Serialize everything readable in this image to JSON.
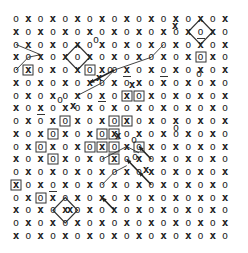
{
  "diagram": {
    "title": "",
    "grid": {
      "rows": 18,
      "cols": 18,
      "origin_x": 16,
      "origin_y": 19,
      "dx": 12.3,
      "dy": 12.75,
      "pattern": "checkerboard",
      "even_symbol": "o",
      "odd_symbol": "x"
    },
    "boxed_cells": [
      {
        "r": 4,
        "c": 1
      },
      {
        "r": 4,
        "c": 6
      },
      {
        "r": 3,
        "c": 15
      },
      {
        "r": 6,
        "c": 9
      },
      {
        "r": 6,
        "c": 10
      },
      {
        "r": 8,
        "c": 8
      },
      {
        "r": 8,
        "c": 9
      },
      {
        "r": 9,
        "c": 3
      },
      {
        "r": 9,
        "c": 7
      },
      {
        "r": 9,
        "c": 8
      },
      {
        "r": 10,
        "c": 2
      },
      {
        "r": 10,
        "c": 6
      },
      {
        "r": 10,
        "c": 7
      },
      {
        "r": 11,
        "c": 3
      },
      {
        "r": 8,
        "c": 4
      },
      {
        "r": 14,
        "c": 2
      },
      {
        "r": 11,
        "c": 8
      },
      {
        "r": 10,
        "c": 8
      },
      {
        "r": 13,
        "c": 0
      },
      {
        "r": 10,
        "c": 10
      }
    ],
    "underlined_cells": [
      {
        "r": 7,
        "c": 7
      },
      {
        "r": 5,
        "c": 9
      },
      {
        "r": 5,
        "c": 12
      },
      {
        "r": 2,
        "c": 15
      },
      {
        "r": 14,
        "c": 3
      },
      {
        "r": 8,
        "c": 2
      }
    ],
    "diamonds": [
      {
        "r": 3,
        "c": 5
      },
      {
        "r": 1,
        "c": 15
      },
      {
        "r": 15,
        "c": 4
      }
    ],
    "arrows": [
      {
        "from": {
          "r": 4,
          "c": 8
        },
        "to": {
          "r": 5,
          "c": 6
        }
      },
      {
        "from": {
          "r": 11,
          "c": 11
        },
        "to": {
          "r": 10,
          "c": 10
        }
      },
      {
        "from": {
          "r": 12,
          "c": 10
        },
        "to": {
          "r": 11,
          "c": 9
        }
      },
      {
        "from": {
          "r": 13,
          "c": 11
        },
        "to": {
          "r": 12,
          "c": 10
        }
      },
      {
        "from": {
          "r": 15,
          "c": 8
        },
        "to": {
          "r": 14,
          "c": 7
        }
      }
    ],
    "diagonal_trails": [
      {
        "points": [
          {
            "r": 2,
            "c": 0
          },
          {
            "r": 2.4,
            "c": 1
          },
          {
            "r": 2.8,
            "c": 2
          },
          {
            "r": 3,
            "c": 1
          },
          {
            "r": 4,
            "c": 0
          }
        ]
      },
      {
        "points": [
          {
            "r": 6,
            "c": 5
          },
          {
            "r": 5,
            "c": 7
          },
          {
            "r": 4,
            "c": 8
          },
          {
            "r": 3,
            "c": 11
          },
          {
            "r": 2,
            "c": 12
          }
        ]
      },
      {
        "points": [
          {
            "r": 11,
            "c": 7
          },
          {
            "r": 10,
            "c": 9
          },
          {
            "r": 10.5,
            "c": 10
          }
        ]
      },
      {
        "points": [
          {
            "r": 13,
            "c": 7
          },
          {
            "r": 12,
            "c": 8
          },
          {
            "r": 11.5,
            "c": 9
          }
        ]
      }
    ],
    "stray_symbols": [
      {
        "sym": "o",
        "x": 96,
        "y": 40
      },
      {
        "sym": "x",
        "x": 175,
        "y": 26
      },
      {
        "sym": "o",
        "x": 199,
        "y": 74
      },
      {
        "sym": "x",
        "x": 99,
        "y": 78
      },
      {
        "sym": "o",
        "x": 110,
        "y": 70
      },
      {
        "sym": "x",
        "x": 132,
        "y": 85
      },
      {
        "sym": "o",
        "x": 176,
        "y": 128
      },
      {
        "sym": "x",
        "x": 70,
        "y": 210
      },
      {
        "sym": "x",
        "x": 118,
        "y": 136
      },
      {
        "sym": "o",
        "x": 134,
        "y": 140
      },
      {
        "sym": "o",
        "x": 135,
        "y": 157
      },
      {
        "sym": "x",
        "x": 146,
        "y": 170
      },
      {
        "sym": "x",
        "x": 73,
        "y": 106
      },
      {
        "sym": "o",
        "x": 60,
        "y": 100
      }
    ]
  }
}
